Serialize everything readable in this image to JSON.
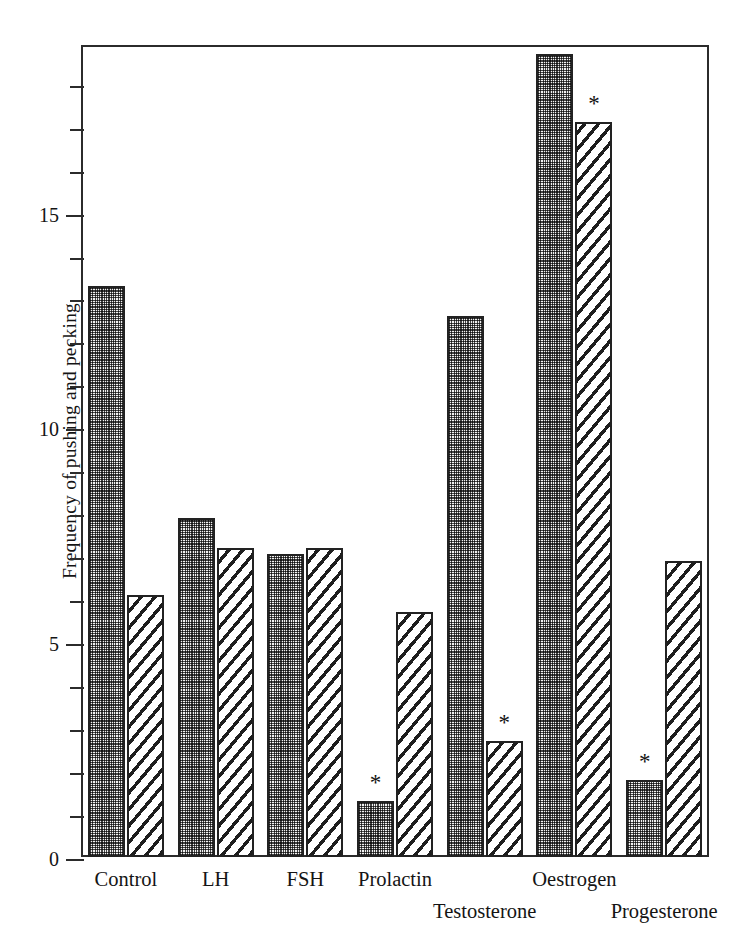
{
  "chart_data": {
    "type": "bar",
    "title": "",
    "xlabel": "",
    "ylabel": "Frequency of pushing and pecking",
    "ylim": [
      0,
      18.9
    ],
    "yticks": [
      0,
      5,
      10,
      15
    ],
    "ytick_labels": [
      "0",
      "5",
      "10",
      "15"
    ],
    "minor_tick_step": 1,
    "grid": false,
    "legend": "none",
    "categories": [
      "Control",
      "LH",
      "FSH",
      "Prolactin",
      "Testosterone",
      "Oestrogen",
      "Progesterone"
    ],
    "series": [
      {
        "name": "stippled",
        "fill": "dotted",
        "values": [
          13.3,
          7.9,
          7.05,
          1.3,
          12.6,
          18.7,
          1.8
        ],
        "significance": [
          "",
          "",
          "",
          "*",
          "",
          "",
          "*"
        ]
      },
      {
        "name": "hatched",
        "fill": "hatched",
        "values": [
          6.1,
          7.2,
          7.2,
          5.7,
          2.7,
          17.1,
          6.9
        ],
        "significance": [
          "",
          "",
          "",
          "",
          "*",
          "*",
          ""
        ]
      }
    ],
    "annotations": [
      {
        "text": "*",
        "category": "Prolactin",
        "series": "stippled"
      },
      {
        "text": "*",
        "category": "Testosterone",
        "series": "hatched"
      },
      {
        "text": "*",
        "category": "Oestrogen",
        "series": "hatched"
      },
      {
        "text": "*",
        "category": "Progesterone",
        "series": "stippled"
      }
    ],
    "label_rows": [
      0,
      0,
      0,
      0,
      1,
      0,
      1
    ]
  },
  "colors": {
    "axis": "#2b2b2b",
    "bar_outline": "#222222",
    "dotted_fill": "#8a8a8a",
    "hatched_fill": "#ffffff",
    "text": "#141414",
    "background": "#ffffff"
  }
}
